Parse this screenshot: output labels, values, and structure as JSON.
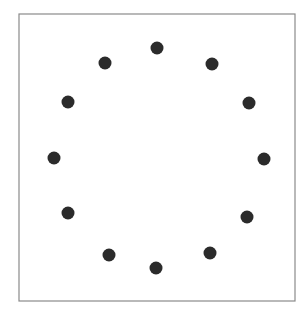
{
  "figure": {
    "type": "dot-circle",
    "frame": {
      "x": 19,
      "y": 14,
      "width": 276,
      "height": 287,
      "stroke": "#8a8a8a",
      "stroke_width": 1.2
    },
    "dot": {
      "radius": 6.5,
      "fill": "#2b2b2b"
    },
    "dots": [
      {
        "x": 157,
        "y": 48
      },
      {
        "x": 212,
        "y": 64
      },
      {
        "x": 249,
        "y": 103
      },
      {
        "x": 264,
        "y": 159
      },
      {
        "x": 247,
        "y": 217
      },
      {
        "x": 210,
        "y": 253
      },
      {
        "x": 156,
        "y": 268
      },
      {
        "x": 109,
        "y": 255
      },
      {
        "x": 68,
        "y": 213
      },
      {
        "x": 54,
        "y": 158
      },
      {
        "x": 68,
        "y": 102
      },
      {
        "x": 105,
        "y": 63
      }
    ]
  }
}
